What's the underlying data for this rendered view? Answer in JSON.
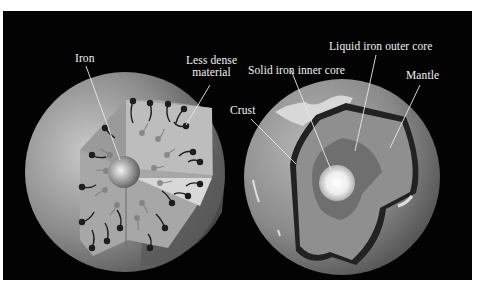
{
  "figure": {
    "background_color": "#030303",
    "page_color": "#ffffff",
    "left_panel": {
      "title": "Early undifferentiated Earth",
      "labels": {
        "iron": "Iron",
        "less_dense_line1": "Less dense",
        "less_dense_line2": "material"
      }
    },
    "right_panel": {
      "title": "Differentiated Earth",
      "labels": {
        "crust": "Crust",
        "inner_core": "Solid iron inner core",
        "outer_core": "Liquid iron outer core",
        "mantle": "Mantle"
      }
    }
  }
}
